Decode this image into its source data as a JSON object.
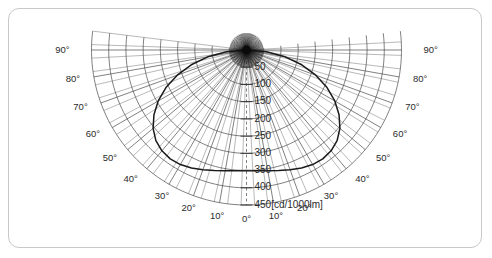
{
  "figure": {
    "kind": "polar-light-distribution-diagram",
    "border_color": "#c9c9c9",
    "background_color": "#ffffff"
  },
  "chart_data": {
    "type": "line",
    "subtype": "polar-intensity-distribution",
    "title": "",
    "xlabel": "",
    "ylabel": "",
    "unit_label": "[cd/1000lm]",
    "radial_axis": {
      "ticks": [
        50,
        100,
        150,
        200,
        250,
        300,
        350,
        400,
        450
      ],
      "tick_labels": [
        "50",
        "100",
        "150",
        "200",
        "250",
        "300",
        "350",
        "400",
        "450"
      ],
      "min": 0,
      "max": 450,
      "step": 50,
      "unit": "cd/1000lm",
      "label_angle_deg": 0,
      "outermost_label_with_unit": "450[cd/1000lm]"
    },
    "angular_axis": {
      "unit": "degrees",
      "step": 10,
      "min": -90,
      "max": 90,
      "zero_position": "bottom",
      "labeled_left": [
        "90°",
        "80°",
        "70°",
        "60°",
        "50°",
        "40°",
        "30°",
        "20°",
        "10°"
      ],
      "labeled_center": [
        "0°"
      ],
      "labeled_right": [
        "10°",
        "20°",
        "30°",
        "40°",
        "50°",
        "60°",
        "70°",
        "80°",
        "90°"
      ]
    },
    "grid": true,
    "legend_position": "none",
    "series": [
      {
        "name": "luminous intensity",
        "color": "#1a1a1a",
        "symmetric": true,
        "angles_deg": [
          0,
          5,
          10,
          15,
          20,
          25,
          30,
          35,
          40,
          45,
          50,
          55,
          60,
          65,
          70,
          75,
          80,
          85,
          90
        ],
        "values": [
          350,
          352,
          356,
          362,
          370,
          378,
          384,
          386,
          382,
          372,
          354,
          328,
          296,
          258,
          214,
          166,
          114,
          58,
          0
        ]
      }
    ]
  },
  "angle_labels": {
    "left": [
      {
        "text": "90°",
        "deg": 90
      },
      {
        "text": "80°",
        "deg": 80
      },
      {
        "text": "70°",
        "deg": 70
      },
      {
        "text": "60°",
        "deg": 60
      },
      {
        "text": "50°",
        "deg": 50
      },
      {
        "text": "40°",
        "deg": 40
      },
      {
        "text": "30°",
        "deg": 30
      },
      {
        "text": "20°",
        "deg": 20
      },
      {
        "text": "10°",
        "deg": 10
      }
    ],
    "center": {
      "text": "0°",
      "deg": 0
    },
    "right": [
      {
        "text": "10°",
        "deg": 10
      },
      {
        "text": "20°",
        "deg": 20
      },
      {
        "text": "30°",
        "deg": 30
      },
      {
        "text": "40°",
        "deg": 40
      },
      {
        "text": "50°",
        "deg": 50
      },
      {
        "text": "60°",
        "deg": 60
      },
      {
        "text": "70°",
        "deg": 70
      },
      {
        "text": "80°",
        "deg": 80
      },
      {
        "text": "90°",
        "deg": 90
      }
    ]
  },
  "radial_labels": [
    {
      "text": "50",
      "value": 50
    },
    {
      "text": "100",
      "value": 100
    },
    {
      "text": "150",
      "value": 150
    },
    {
      "text": "200",
      "value": 200
    },
    {
      "text": "250",
      "value": 250
    },
    {
      "text": "300",
      "value": 300
    },
    {
      "text": "350",
      "value": 350
    },
    {
      "text": "400",
      "value": 400
    },
    {
      "text": "450[cd/1000lm]",
      "value": 450
    }
  ]
}
